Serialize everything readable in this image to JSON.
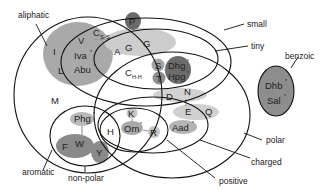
{
  "diagram": {
    "type": "venn",
    "colors": {
      "outline": "#111111",
      "light_fill": "#cfcfcf",
      "mid_fill": "#9b9b9b",
      "dark_fill": "#6e6e6e"
    },
    "sets": {
      "aliphatic": "aliphatic",
      "small": "small",
      "tiny": "tiny",
      "benzoic": "benzoic",
      "polar": "polar",
      "charged": "charged",
      "positive": "positive",
      "aromatic": "aromatic",
      "non_polar": "non-polar"
    },
    "residues": {
      "P": "P",
      "C_ss_main": "C",
      "C_ss_sub": "S-S",
      "I": "I",
      "L": "L",
      "V": "V",
      "Iva": "Iva",
      "Abu": "Abu",
      "A": "A",
      "G1": "G",
      "G2": "G",
      "C_hh_main": "C",
      "C_hh_sub": "H-H",
      "S": "S",
      "T": "T",
      "Dhg": "Dhg",
      "Hpg": "Hpg",
      "Dhb": "Dhb",
      "Sal": "Sal",
      "M": "M",
      "D": "D",
      "N": "N",
      "E": "E",
      "Q": "Q",
      "Aad": "Aad",
      "K": "K",
      "H": "H",
      "Om": "Om",
      "R": "R",
      "Phg": "Phg",
      "F": "F",
      "W": "W",
      "Y": "Y"
    },
    "nonstandard_marker": "*"
  }
}
